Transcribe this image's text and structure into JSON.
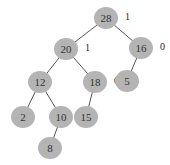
{
  "tree": {
    "nodes": [
      {
        "id": "n28",
        "label": "28",
        "balance": "1"
      },
      {
        "id": "n20",
        "label": "20",
        "balance": "1"
      },
      {
        "id": "n16",
        "label": "16",
        "balance": "0"
      },
      {
        "id": "n12",
        "label": "12",
        "balance": ""
      },
      {
        "id": "n18",
        "label": "18",
        "balance": "0"
      },
      {
        "id": "n5",
        "label": "5",
        "balance": ""
      },
      {
        "id": "n2",
        "label": "2",
        "balance": ""
      },
      {
        "id": "n10",
        "label": "10",
        "balance": ""
      },
      {
        "id": "n15",
        "label": "15",
        "balance": ""
      },
      {
        "id": "n8",
        "label": "8",
        "balance": ""
      }
    ],
    "edges": [
      {
        "from": "n28",
        "to": "n20"
      },
      {
        "from": "n28",
        "to": "n16"
      },
      {
        "from": "n20",
        "to": "n12"
      },
      {
        "from": "n20",
        "to": "n18"
      },
      {
        "from": "n16",
        "to": "n5"
      },
      {
        "from": "n12",
        "to": "n2"
      },
      {
        "from": "n12",
        "to": "n10"
      },
      {
        "from": "n18",
        "to": "n15"
      },
      {
        "from": "n10",
        "to": "n8"
      }
    ]
  }
}
